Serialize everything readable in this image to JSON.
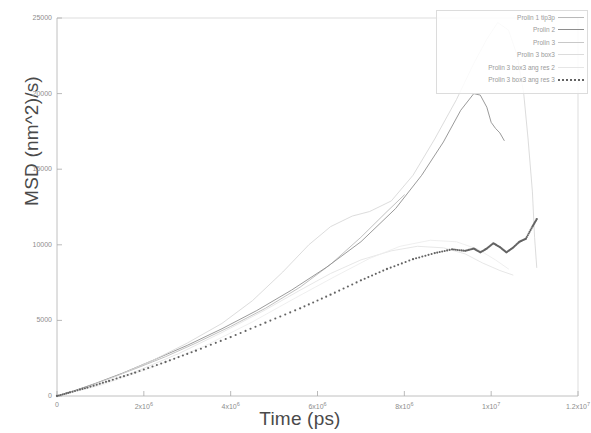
{
  "chart_data": {
    "type": "line",
    "title": "",
    "xlabel": "Time (ps)",
    "ylabel": "MSD (nm^2)/s)",
    "xlim": [
      0,
      12000000
    ],
    "ylim": [
      0,
      25000
    ],
    "grid": false,
    "legend_position": "top-right",
    "x_ticks": [
      {
        "value": 0,
        "label": "0"
      },
      {
        "value": 2000000,
        "label": "2x10",
        "exp": "6"
      },
      {
        "value": 4000000,
        "label": "4x10",
        "exp": "6"
      },
      {
        "value": 6000000,
        "label": "6x10",
        "exp": "6"
      },
      {
        "value": 8000000,
        "label": "8x10",
        "exp": "6"
      },
      {
        "value": 10000000,
        "label": "1x10",
        "exp": "7"
      },
      {
        "value": 12000000,
        "label": "1.2x10",
        "exp": "7"
      }
    ],
    "y_ticks": [
      {
        "value": 0,
        "label": "0"
      },
      {
        "value": 5000,
        "label": "5000"
      },
      {
        "value": 10000,
        "label": "10000"
      },
      {
        "value": 15000,
        "label": "15000"
      },
      {
        "value": 20000,
        "label": "20000"
      },
      {
        "value": 25000,
        "label": "25000"
      },
      {
        "value": 30000,
        "label": "30000"
      },
      {
        "value": 35000,
        "label": "35000"
      }
    ],
    "series": [
      {
        "name": "Prolin 1 tip3p",
        "style": "solid",
        "color": "#b9b9b9",
        "points": [
          [
            0,
            0
          ],
          [
            300000,
            260
          ],
          [
            700000,
            620
          ],
          [
            1200000,
            1150
          ],
          [
            1800000,
            1800
          ],
          [
            2500000,
            2600
          ],
          [
            3200000,
            3500
          ],
          [
            4000000,
            4600
          ],
          [
            4800000,
            5800
          ],
          [
            5600000,
            7200
          ],
          [
            6300000,
            8700
          ],
          [
            7000000,
            10500
          ],
          [
            7600000,
            12200
          ],
          [
            8000000,
            13300
          ]
        ]
      },
      {
        "name": "Prolin 2",
        "style": "solid",
        "color": "#8e8e8e",
        "points": [
          [
            0,
            0
          ],
          [
            400000,
            350
          ],
          [
            900000,
            850
          ],
          [
            1500000,
            1500
          ],
          [
            2200000,
            2350
          ],
          [
            3000000,
            3350
          ],
          [
            3800000,
            4450
          ],
          [
            4600000,
            5650
          ],
          [
            5400000,
            7000
          ],
          [
            6200000,
            8500
          ],
          [
            7000000,
            10200
          ],
          [
            7800000,
            12400
          ],
          [
            8400000,
            14600
          ],
          [
            8900000,
            16800
          ],
          [
            9300000,
            18900
          ],
          [
            9600000,
            20000
          ],
          [
            9750000,
            19900
          ],
          [
            9900000,
            19100
          ],
          [
            10000000,
            18100
          ],
          [
            10100000,
            17700
          ],
          [
            10200000,
            17400
          ],
          [
            10300000,
            16900
          ]
        ]
      },
      {
        "name": "Prolin 3",
        "style": "solid",
        "color": "#d8d8d8",
        "points": [
          [
            0,
            0
          ],
          [
            600000,
            500
          ],
          [
            1400000,
            1350
          ],
          [
            2200000,
            2350
          ],
          [
            3000000,
            3500
          ],
          [
            3800000,
            4800
          ],
          [
            4500000,
            6300
          ],
          [
            5200000,
            8200
          ],
          [
            5800000,
            10000
          ],
          [
            6300000,
            11200
          ],
          [
            6800000,
            11900
          ],
          [
            7200000,
            12200
          ],
          [
            7700000,
            12900
          ],
          [
            8200000,
            14600
          ],
          [
            8700000,
            17000
          ],
          [
            9200000,
            19600
          ],
          [
            9600000,
            22000
          ],
          [
            9900000,
            23600
          ],
          [
            10150000,
            24700
          ],
          [
            10400000,
            24200
          ],
          [
            10600000,
            22500
          ],
          [
            10750000,
            20000
          ],
          [
            10850000,
            17000
          ],
          [
            10950000,
            13500
          ],
          [
            11000000,
            10500
          ],
          [
            11050000,
            8500
          ]
        ]
      },
      {
        "name": "Prolin 3 box3",
        "style": "solid",
        "color": "#e4e4e4",
        "points": [
          [
            0,
            0
          ],
          [
            800000,
            600
          ],
          [
            1800000,
            1600
          ],
          [
            2800000,
            2800
          ],
          [
            3800000,
            4200
          ],
          [
            4800000,
            5700
          ],
          [
            5600000,
            7000
          ],
          [
            6300000,
            8100
          ],
          [
            7000000,
            9000
          ],
          [
            7700000,
            9600
          ],
          [
            8300000,
            9900
          ],
          [
            8900000,
            9800
          ],
          [
            9400000,
            9400
          ],
          [
            9800000,
            8800
          ],
          [
            10200000,
            8300
          ],
          [
            10500000,
            8000
          ]
        ]
      },
      {
        "name": "Prolin 3 box3 ang res 2",
        "style": "solid",
        "color": "#ededed",
        "points": [
          [
            0,
            0
          ],
          [
            1000000,
            700
          ],
          [
            2200000,
            1900
          ],
          [
            3400000,
            3300
          ],
          [
            4500000,
            4900
          ],
          [
            5500000,
            6500
          ],
          [
            6400000,
            7900
          ],
          [
            7200000,
            9100
          ],
          [
            7900000,
            9900
          ],
          [
            8600000,
            10300
          ],
          [
            9200000,
            10200
          ],
          [
            9700000,
            9700
          ],
          [
            10100000,
            9000
          ],
          [
            10400000,
            8400
          ]
        ]
      },
      {
        "name": "Prolin 3 box3 ang res 3",
        "style": "dotted",
        "color": "#636363",
        "points": [
          [
            0,
            0
          ],
          [
            300000,
            240
          ],
          [
            700000,
            560
          ],
          [
            1200000,
            1000
          ],
          [
            1800000,
            1550
          ],
          [
            2500000,
            2250
          ],
          [
            3200000,
            3000
          ],
          [
            4000000,
            3900
          ],
          [
            4800000,
            4850
          ],
          [
            5600000,
            5800
          ],
          [
            6300000,
            6700
          ],
          [
            7000000,
            7650
          ],
          [
            7600000,
            8400
          ],
          [
            8200000,
            9050
          ],
          [
            8700000,
            9450
          ],
          [
            9100000,
            9700
          ],
          [
            9400000,
            9600
          ],
          [
            9600000,
            9750
          ],
          [
            9750000,
            9500
          ],
          [
            9900000,
            9750
          ],
          [
            10050000,
            10100
          ],
          [
            10200000,
            9850
          ],
          [
            10350000,
            9500
          ],
          [
            10500000,
            9800
          ],
          [
            10650000,
            10200
          ],
          [
            10800000,
            10400
          ],
          [
            10950000,
            11200
          ],
          [
            11050000,
            11700
          ]
        ]
      }
    ]
  },
  "legend": {
    "entries": [
      {
        "label": "Prolin 1 tip3p",
        "style": "solid",
        "color": "#b9b9b9"
      },
      {
        "label": "Prolin 2",
        "style": "solid",
        "color": "#8e8e8e"
      },
      {
        "label": "Prolin 3",
        "style": "solid",
        "color": "#c8c8c8"
      },
      {
        "label": "Prolin 3 box3",
        "style": "solid",
        "color": "#dcdcdc"
      },
      {
        "label": "Prolin 3 box3 ang res 2",
        "style": "solid",
        "color": "#e6e6e6"
      },
      {
        "label": "Prolin 3 box3 ang res 3",
        "style": "dotted",
        "color": "#636363"
      }
    ]
  }
}
